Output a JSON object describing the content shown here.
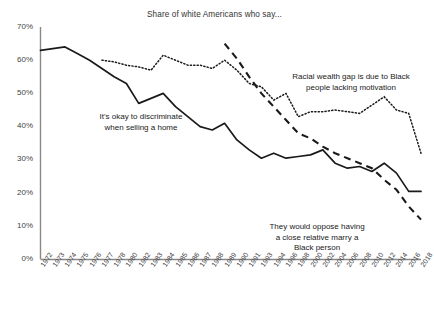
{
  "chart_data": {
    "type": "line",
    "title": "Share of white Americans who say...",
    "xlabel": "",
    "ylabel": "",
    "ylim": [
      0,
      70
    ],
    "yticks": [
      0,
      10,
      20,
      30,
      40,
      50,
      60,
      70
    ],
    "ytick_labels": [
      "0%",
      "10%",
      "20%",
      "30%",
      "40%",
      "50%",
      "60%",
      "70%"
    ],
    "grid": false,
    "legend_position": "annotations-inline",
    "categories": [
      "1972",
      "1973",
      "1974",
      "1975",
      "1976",
      "1977",
      "1978",
      "1980",
      "1982",
      "1983",
      "1984",
      "1985",
      "1986",
      "1987",
      "1988",
      "1989",
      "1990",
      "1991",
      "1993",
      "1994",
      "1996",
      "1998",
      "2000",
      "2002",
      "2004",
      "2006",
      "2008",
      "2010",
      "2012",
      "2014",
      "2016",
      "2018"
    ],
    "series": [
      {
        "name": "It's okay to discriminate when selling a home",
        "style": "solid",
        "color": "#1a1a1a",
        "values": [
          63,
          63.5,
          64,
          62,
          60,
          57.5,
          55,
          53,
          47,
          48.5,
          50,
          46,
          43,
          40,
          39,
          41,
          36,
          33,
          30.5,
          32,
          30.5,
          31,
          31.5,
          33,
          29,
          27.5,
          28,
          26.5,
          29,
          26,
          20.5,
          20.5
        ]
      },
      {
        "name": "Racial wealth gap is due to Black people lacking motivation",
        "style": "dotted",
        "color": "#1a1a1a",
        "values": [
          null,
          null,
          null,
          null,
          null,
          60,
          59.5,
          58.5,
          58,
          57,
          61.5,
          60,
          58.5,
          58.5,
          57.5,
          60,
          57,
          53,
          52,
          48,
          50,
          43,
          44.5,
          44.5,
          45,
          44.5,
          44,
          46.5,
          49,
          45,
          44,
          32
        ]
      },
      {
        "name": "They would oppose having a close relative marry a Black person",
        "style": "dashed",
        "color": "#1a1a1a",
        "values": [
          null,
          null,
          null,
          null,
          null,
          null,
          null,
          null,
          null,
          null,
          null,
          null,
          null,
          null,
          null,
          65,
          60.5,
          55,
          50,
          46,
          42,
          38,
          36.5,
          34,
          32,
          30.5,
          29,
          27.5,
          24,
          21,
          16,
          12
        ]
      }
    ],
    "annotations": [
      {
        "id": "home",
        "text": "It's okay to discriminate\nwhen selling a home"
      },
      {
        "id": "wealth",
        "text": "Racial wealth gap is due to Black\npeople lacking motivation"
      },
      {
        "id": "marry",
        "text": "They would oppose having\na close relative marry a\nBlack person"
      }
    ]
  }
}
